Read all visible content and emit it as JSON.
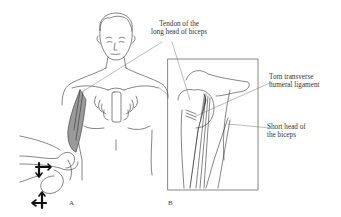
{
  "figure": {
    "panels": [
      {
        "id": "A",
        "label": "A",
        "description": "Front view of patient with examiner resisting forearm flexion/supination (Speed/Yergason test); biceps muscle shaded"
      },
      {
        "id": "B",
        "label": "B",
        "description": "Inset of shoulder showing bicipital groove and tendons"
      }
    ],
    "annotations": [
      {
        "id": "long-head-tendon",
        "lines": [
          "Tendon of the",
          "long head of biceps"
        ]
      },
      {
        "id": "torn-ligament",
        "lines": [
          "Torn transverse",
          "humeral ligament"
        ]
      },
      {
        "id": "short-head",
        "lines": [
          "Short head of",
          "the biceps"
        ]
      }
    ],
    "arrows": [
      {
        "id": "arrow-cross-upper",
        "directions": [
          "right",
          "down"
        ]
      },
      {
        "id": "arrow-cross-lower",
        "directions": [
          "left",
          "up",
          "down"
        ]
      }
    ],
    "colors": {
      "line": "#333333",
      "muscle_fill": "#9a9a9a",
      "background": "#ffffff"
    }
  }
}
